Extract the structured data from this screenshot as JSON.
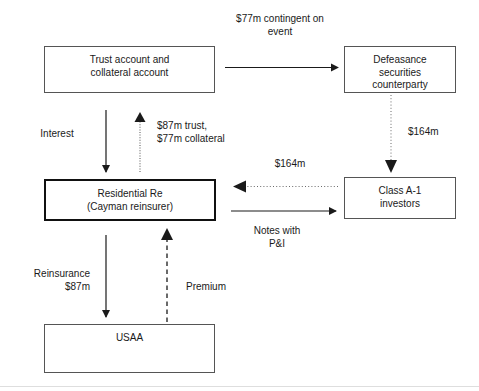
{
  "diagram": {
    "boxes": {
      "trust": {
        "lines": [
          "Trust account and",
          "collateral account"
        ]
      },
      "defeasance": {
        "lines": [
          "Defeasance",
          "securities",
          "counterparty"
        ]
      },
      "residential_re": {
        "lines": [
          "Residential Re",
          "(Cayman reinsurer)"
        ]
      },
      "class_a1": {
        "lines": [
          "Class A-1",
          "investors"
        ]
      },
      "usaa": {
        "lines": [
          "USAA"
        ]
      }
    },
    "labels": {
      "contingent": {
        "lines": [
          "$77m contingent on",
          "event"
        ]
      },
      "interest": {
        "lines": [
          "Interest"
        ]
      },
      "trust_collateral": {
        "lines": [
          "$87m trust,",
          "$77m collateral"
        ]
      },
      "notes_proceeds": {
        "lines": [
          "$164m"
        ]
      },
      "defeasance_flow": {
        "lines": [
          "$164m"
        ]
      },
      "notes_with_pi": {
        "lines": [
          "Notes with",
          "P&I"
        ]
      },
      "reinsurance": {
        "lines": [
          "Reinsurance",
          "$87m"
        ]
      },
      "premium": {
        "lines": [
          "Premium"
        ]
      }
    },
    "colors": {
      "ink": "#1a1a1a",
      "box_border": "#555555",
      "box_border_emphasis": "#111111",
      "arrow_solid": "#1a1a1a",
      "arrow_faint": "#a8a8a8",
      "page_rule": "#dedede"
    },
    "edges": [
      {
        "name": "trust-to-defeasance",
        "style": "solid",
        "direction": "right",
        "label": "$77m contingent on event"
      },
      {
        "name": "trust-to-residential-re",
        "style": "solid",
        "direction": "down",
        "label": "Interest"
      },
      {
        "name": "residential-re-to-trust",
        "style": "dotted-faint",
        "direction": "up",
        "label": "$87m trust, $77m collateral"
      },
      {
        "name": "defeasance-to-class-a1",
        "style": "dotted",
        "direction": "down",
        "label": "$164m"
      },
      {
        "name": "class-a1-to-residential-re",
        "style": "dotted",
        "direction": "left",
        "label": "$164m"
      },
      {
        "name": "residential-re-to-class-a1",
        "style": "solid",
        "direction": "right",
        "label": "Notes with P&I"
      },
      {
        "name": "residential-re-to-usaa",
        "style": "solid",
        "direction": "down",
        "label": "Reinsurance $87m"
      },
      {
        "name": "usaa-to-residential-re",
        "style": "dashed",
        "direction": "up",
        "label": "Premium"
      }
    ]
  }
}
